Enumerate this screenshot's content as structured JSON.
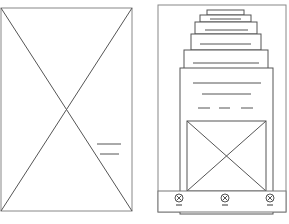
{
  "diagram": {
    "type": "wireframe-sketch",
    "stroke_color": "#555555",
    "frames": [
      {
        "name": "left-frame",
        "content": "image-placeholder",
        "annotation_lines": 2
      },
      {
        "name": "right-frame",
        "stacked_cards": 6,
        "front_card": {
          "text_lines": 2,
          "dashed_line_segments": 3,
          "image_placeholder": true
        },
        "bottom_bar": {
          "icons": [
            "close-circle-icon",
            "close-circle-icon",
            "close-circle-icon"
          ]
        }
      }
    ]
  }
}
